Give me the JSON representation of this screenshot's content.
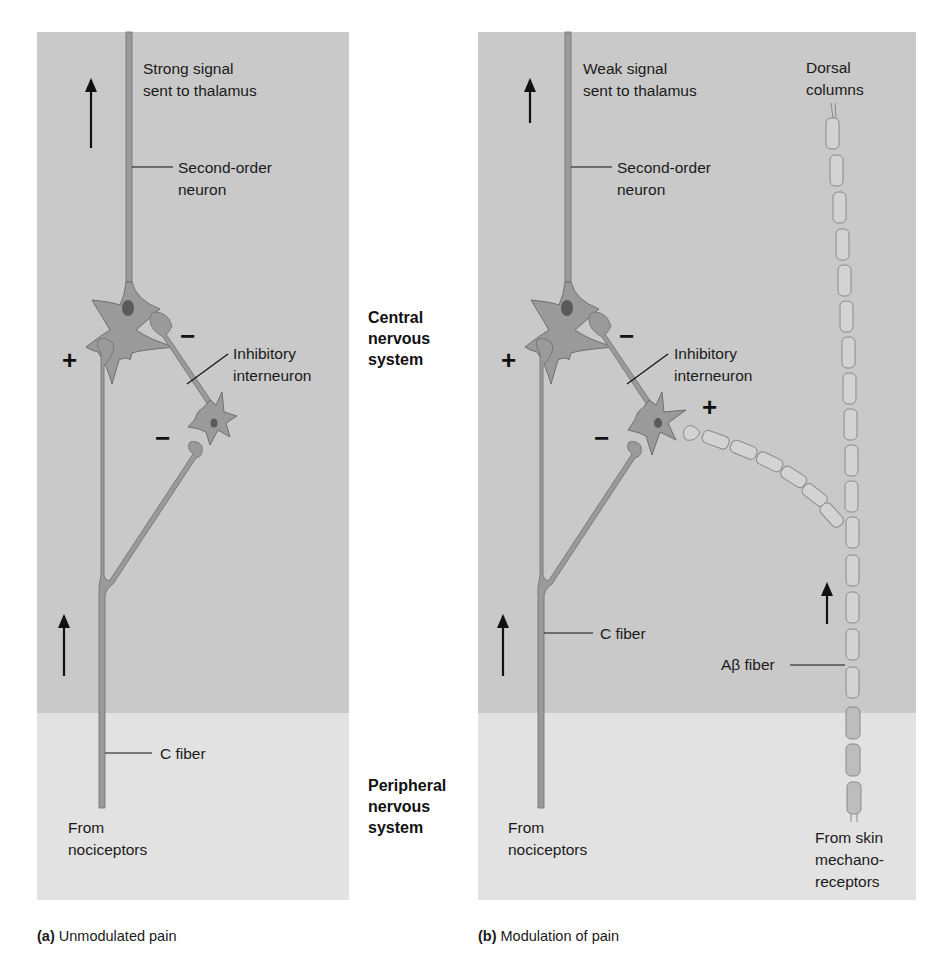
{
  "figure": {
    "colors": {
      "cns_background": "#c9c9c9",
      "pns_background": "#e2e2e2",
      "neuron_fill": "#9a9a9a",
      "neuron_stroke": "#6e6e6e",
      "nucleus": "#5a5a5a",
      "myelin_fill": "#d3d3d3",
      "myelin_stroke": "#8a8a8a"
    },
    "regions": {
      "cns_label_lines": [
        "Central",
        "nervous",
        "system"
      ],
      "pns_label_lines": [
        "Peripheral",
        "nervous",
        "system"
      ]
    },
    "panel_a": {
      "caption_letter": "(a)",
      "caption_text": " Unmodulated pain",
      "signal_label_lines": [
        "Strong signal",
        "sent to thalamus"
      ],
      "second_order_label_lines": [
        "Second-order",
        "neuron"
      ],
      "inhibitory_label_lines": [
        "Inhibitory",
        "interneuron"
      ],
      "c_fiber_label": "C fiber",
      "source_label_lines": [
        "From",
        "nociceptors"
      ],
      "signs": {
        "excitatory": "+",
        "inhibitory_top": "−",
        "inhibitory_bottom": "−"
      }
    },
    "panel_b": {
      "caption_letter": "(b)",
      "caption_text": " Modulation of pain",
      "signal_label_lines": [
        "Weak signal",
        "sent to thalamus"
      ],
      "second_order_label_lines": [
        "Second-order",
        "neuron"
      ],
      "inhibitory_label_lines": [
        "Inhibitory",
        "interneuron"
      ],
      "dorsal_label_lines": [
        "Dorsal",
        "columns"
      ],
      "c_fiber_label": "C fiber",
      "abeta_label": "Aβ fiber",
      "source_nociceptor_lines": [
        "From",
        "nociceptors"
      ],
      "source_mechano_lines": [
        "From skin",
        "mechano-",
        "receptors"
      ],
      "signs": {
        "excitatory": "+",
        "inhibitory_top": "−",
        "inhibitory_bottom": "−",
        "abeta_excitatory": "+"
      }
    }
  }
}
